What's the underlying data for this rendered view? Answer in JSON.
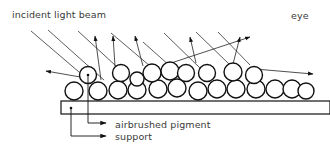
{
  "diagram": {
    "labels": {
      "incident": "incident light beam",
      "eye": "eye",
      "pigment": "airbrushed pigment",
      "support": "support"
    },
    "colors": {
      "line": "#222222",
      "text": "#3a3a3a",
      "background": "#ffffff"
    },
    "elements": {
      "incident_beams": 8,
      "reflected_rays": 6,
      "pigment_particles": 22,
      "support_layer": 1
    }
  }
}
